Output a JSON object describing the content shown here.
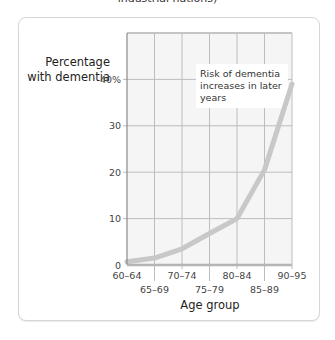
{
  "header": {
    "title_fragment": "industrial nations)"
  },
  "chart_data": {
    "type": "line",
    "title": "",
    "ylabel": [
      "Percentage",
      "with dementia"
    ],
    "xlabel": "Age group",
    "categories": [
      "60–64",
      "65–69",
      "70–74",
      "75–79",
      "80–84",
      "85–89",
      "90–95"
    ],
    "series": [
      {
        "name": "Percentage with dementia",
        "values": [
          0.7,
          1.5,
          3.5,
          6.8,
          10,
          20.5,
          39
        ]
      }
    ],
    "ylim": [
      0,
      50
    ],
    "yticks": [
      0,
      10,
      20,
      30,
      40
    ],
    "ytick_labels": [
      "0",
      "10",
      "20",
      "30",
      "40%"
    ],
    "grid": true,
    "annotation": [
      "Risk of dementia",
      "increases in later",
      "years"
    ],
    "colors": {
      "line": "#c8c8c8",
      "grid": "#bdbdbd",
      "axis": "#8a8a8a",
      "plot_bg": "#f5f5f5"
    }
  }
}
